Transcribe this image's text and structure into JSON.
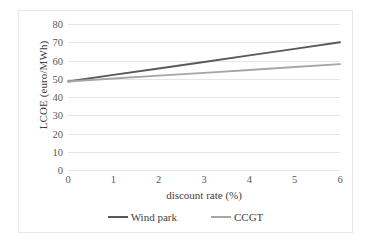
{
  "chart_data": {
    "type": "line",
    "title": "",
    "xlabel": "discount rate (%)",
    "ylabel": "LCOE (euro/MWh)",
    "x": [
      0,
      1,
      2,
      3,
      4,
      5,
      6
    ],
    "xlim": [
      0,
      6
    ],
    "ylim": [
      0,
      80
    ],
    "xticks": [
      "0",
      "1",
      "2",
      "3",
      "4",
      "5",
      "6"
    ],
    "yticks": [
      "0",
      "10",
      "20",
      "30",
      "40",
      "50",
      "60",
      "70",
      "80"
    ],
    "grid": "horizontal",
    "legend_position": "bottom-center",
    "series": [
      {
        "name": "Wind park",
        "values": [
          48.5,
          52.1,
          55.6,
          59.2,
          62.8,
          66.4,
          70.0
        ],
        "color": "#595959"
      },
      {
        "name": "CCGT",
        "values": [
          48.5,
          50.1,
          51.7,
          53.2,
          54.8,
          56.4,
          58.0
        ],
        "color": "#a6a6a6"
      }
    ]
  },
  "legend": {
    "items": [
      {
        "label": "Wind park",
        "color": "#595959"
      },
      {
        "label": "CCGT",
        "color": "#a6a6a6"
      }
    ]
  },
  "frame": {
    "border_color": "#e8e8e8",
    "gridline_color": "#e6e6e6",
    "background": "#ffffff"
  }
}
